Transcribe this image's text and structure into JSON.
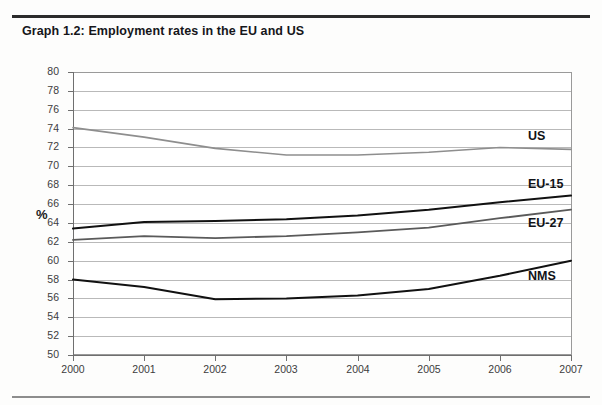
{
  "figure": {
    "title": "Graph 1.2: Employment rates in the EU and US"
  },
  "chart_data": {
    "type": "line",
    "title": "Graph 1.2: Employment rates in the EU and US",
    "xlabel": "",
    "ylabel": "%",
    "x": [
      2000,
      2001,
      2002,
      2003,
      2004,
      2005,
      2006,
      2007
    ],
    "categories": [
      "2000",
      "2001",
      "2002",
      "2003",
      "2004",
      "2005",
      "2006",
      "2007"
    ],
    "ylim": [
      50,
      80
    ],
    "ytick_step": 2,
    "yticks": [
      80,
      78,
      76,
      74,
      72,
      70,
      68,
      66,
      64,
      62,
      60,
      58,
      56,
      54,
      52,
      50
    ],
    "ytick_labels": [
      "80",
      "78",
      "76",
      "74",
      "72",
      "70",
      "68",
      "66",
      "64",
      "62",
      "60",
      "58",
      "56",
      "54",
      "52",
      "50"
    ],
    "grid": true,
    "grid_axis": "y",
    "legend_position": "inline-right",
    "series": [
      {
        "name": "US",
        "label": "US",
        "color": "#8e8e8e",
        "width": 1.6,
        "values": [
          74.1,
          73.1,
          71.9,
          71.2,
          71.2,
          71.5,
          72.0,
          71.8
        ]
      },
      {
        "name": "EU-15",
        "label": "EU-15",
        "color": "#111111",
        "width": 2.0,
        "values": [
          63.4,
          64.1,
          64.2,
          64.4,
          64.8,
          65.4,
          66.2,
          66.9
        ]
      },
      {
        "name": "EU-27",
        "label": "EU-27",
        "color": "#5a5a5a",
        "width": 1.8,
        "values": [
          62.2,
          62.6,
          62.4,
          62.6,
          63.0,
          63.5,
          64.5,
          65.4
        ]
      },
      {
        "name": "NMS",
        "label": "NMS",
        "color": "#111111",
        "width": 2.0,
        "values": [
          58.0,
          57.2,
          55.9,
          56.0,
          56.3,
          57.0,
          58.4,
          60.0
        ]
      }
    ],
    "annotations": [
      {
        "text": "US",
        "series": "US",
        "x": 528,
        "y": 137
      },
      {
        "text": "EU-15",
        "series": "EU-15",
        "x": 528,
        "y": 185
      },
      {
        "text": "EU-27",
        "series": "EU-27",
        "x": 528,
        "y": 224
      },
      {
        "text": "NMS",
        "series": "NMS",
        "x": 528,
        "y": 277
      }
    ]
  }
}
